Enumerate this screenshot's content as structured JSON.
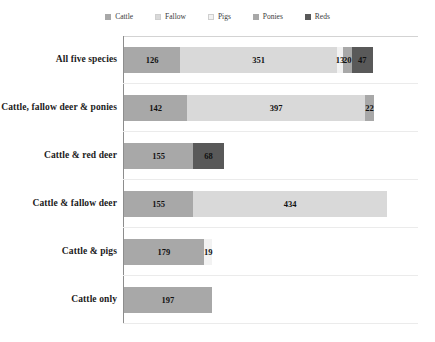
{
  "chart_data": {
    "type": "bar",
    "orientation": "horizontal",
    "stacked": true,
    "title": "",
    "subtitle": "",
    "xlabel": "",
    "ylabel": "",
    "grid": true,
    "legend_position": "top",
    "xlim": [
      0,
      660
    ],
    "categories": [
      "All five species",
      "Cattle, fallow deer & ponies",
      "Cattle & red deer",
      "Cattle & fallow deer",
      "Cattle & pigs",
      "Cattle only"
    ],
    "series": [
      {
        "name": "Cattle",
        "color": "#a8a8a8",
        "values": [
          126,
          142,
          155,
          155,
          179,
          197
        ]
      },
      {
        "name": "Fallow",
        "color": "#d9d9d9",
        "values": [
          351,
          397,
          0,
          434,
          0,
          0
        ]
      },
      {
        "name": "Pigs",
        "color": "#f2f2f2",
        "values": [
          13,
          0,
          0,
          0,
          19,
          0
        ]
      },
      {
        "name": "Ponies",
        "color": "#a8a8a8",
        "values": [
          20,
          22,
          0,
          0,
          0,
          0
        ]
      },
      {
        "name": "Reds",
        "color": "#595959",
        "values": [
          47,
          0,
          68,
          0,
          0,
          0
        ]
      }
    ],
    "bar_totals": [
      557,
      561,
      223,
      589,
      198,
      197
    ]
  },
  "legend": {
    "entries": [
      {
        "label": "Cattle",
        "color": "#a8a8a8"
      },
      {
        "label": "Fallow",
        "color": "#d9d9d9"
      },
      {
        "label": "Pigs",
        "color": "#f2f2f2"
      },
      {
        "label": "Ponies",
        "color": "#a8a8a8"
      },
      {
        "label": "Reds",
        "color": "#595959"
      }
    ]
  },
  "rows": [
    {
      "label": "All five species",
      "segments": [
        {
          "series": "Cattle",
          "value": "126",
          "n": 126,
          "color": "#a8a8a8"
        },
        {
          "series": "Fallow",
          "value": "351",
          "n": 351,
          "color": "#d9d9d9"
        },
        {
          "series": "Pigs",
          "value": "13",
          "n": 13,
          "color": "#f2f2f2"
        },
        {
          "series": "Ponies",
          "value": "20",
          "n": 20,
          "color": "#a8a8a8"
        },
        {
          "series": "Reds",
          "value": "47",
          "n": 47,
          "color": "#595959"
        }
      ]
    },
    {
      "label": "Cattle, fallow deer & ponies",
      "segments": [
        {
          "series": "Cattle",
          "value": "142",
          "n": 142,
          "color": "#a8a8a8"
        },
        {
          "series": "Fallow",
          "value": "397",
          "n": 397,
          "color": "#d9d9d9"
        },
        {
          "series": "Ponies",
          "value": "22",
          "n": 22,
          "color": "#a8a8a8"
        }
      ]
    },
    {
      "label": "Cattle & red deer",
      "segments": [
        {
          "series": "Cattle",
          "value": "155",
          "n": 155,
          "color": "#a8a8a8"
        },
        {
          "series": "Reds",
          "value": "68",
          "n": 68,
          "color": "#595959"
        }
      ]
    },
    {
      "label": "Cattle & fallow deer",
      "segments": [
        {
          "series": "Cattle",
          "value": "155",
          "n": 155,
          "color": "#a8a8a8"
        },
        {
          "series": "Fallow",
          "value": "434",
          "n": 434,
          "color": "#d9d9d9"
        }
      ]
    },
    {
      "label": "Cattle & pigs",
      "segments": [
        {
          "series": "Cattle",
          "value": "179",
          "n": 179,
          "color": "#a8a8a8"
        },
        {
          "series": "Pigs",
          "value": "19",
          "n": 19,
          "color": "#f2f2f2"
        }
      ]
    },
    {
      "label": "Cattle only",
      "segments": [
        {
          "series": "Cattle",
          "value": "197",
          "n": 197,
          "color": "#a8a8a8"
        }
      ]
    }
  ]
}
